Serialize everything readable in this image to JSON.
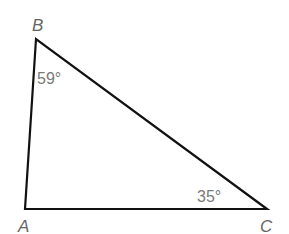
{
  "diagram": {
    "type": "triangle",
    "vertices": [
      {
        "name": "A",
        "x": 25,
        "y": 209,
        "label": "A",
        "label_x": 20,
        "label_y": 232
      },
      {
        "name": "B",
        "x": 36,
        "y": 39,
        "label": "B",
        "label_x": 32,
        "label_y": 31
      },
      {
        "name": "C",
        "x": 267,
        "y": 209,
        "label": "C",
        "label_x": 260,
        "label_y": 232
      }
    ],
    "angles": [
      {
        "vertex": "B",
        "value": "59°",
        "x": 37,
        "y": 84
      },
      {
        "vertex": "C",
        "value": "35°",
        "x": 197,
        "y": 202
      }
    ],
    "colors": {
      "stroke": "#111111",
      "label": "#666666",
      "angle_label": "#7a7a7a"
    }
  }
}
